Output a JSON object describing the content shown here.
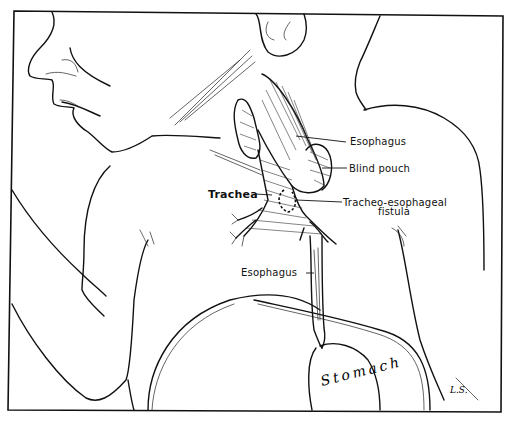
{
  "figure": {
    "labels": {
      "esophagus_upper": "Esophagus",
      "blind_pouch": "Blind pouch",
      "trachea": "Trachea",
      "fistula_line1": "Tracheo-esophageal",
      "fistula_line2": "fistula",
      "esophagus_lower": "Esophagus",
      "stomach": "Stomach"
    },
    "signature": "L.S.",
    "colors": {
      "ink": "#111111",
      "paper": "#ffffff"
    }
  }
}
